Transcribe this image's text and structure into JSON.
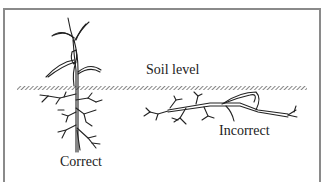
{
  "figure": {
    "labels": {
      "soil_level": "Soil level",
      "correct": "Correct",
      "incorrect": "Incorrect"
    },
    "colors": {
      "ink": "#222222",
      "frame": "#8a8a8a",
      "background": "#ffffff"
    }
  }
}
